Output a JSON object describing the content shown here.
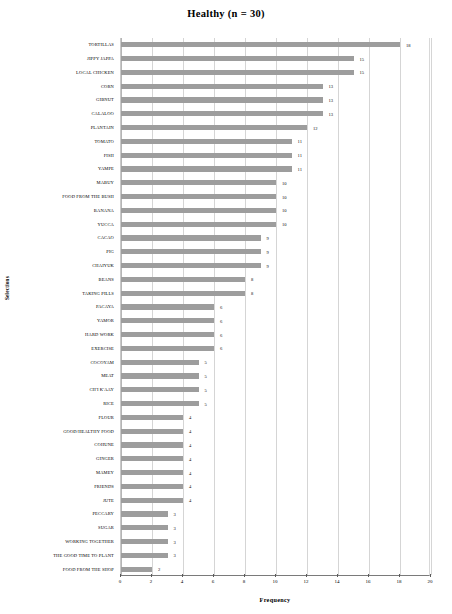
{
  "chart_data": {
    "type": "bar",
    "orientation": "horizontal",
    "title": "Healthy  (n = 30)",
    "xlabel": "Frequency",
    "ylabel": "Selections",
    "xlim": [
      0,
      20
    ],
    "xticks": [
      0,
      2,
      4,
      6,
      8,
      10,
      12,
      14,
      16,
      18,
      20
    ],
    "grid": "vertical",
    "legend": "none",
    "bar_color": "#9d9d9d",
    "categories": [
      "TORTILLAS",
      "JIPPY JAPPA",
      "LOCAL CHICKEN",
      "CORN",
      "GIBNUT",
      "CALALOO",
      "PLANTAIN",
      "TOMATO",
      "FISH",
      "YAMPE",
      "MABUY",
      "FOOD FROM THE BUSH",
      "BANANA",
      "YUCCA",
      "CACAO",
      "PIG",
      "CHAIYUK",
      "BEANS",
      "TAKING PILLS",
      "PACAYA",
      "YAMOR",
      "HARD WORK",
      "EXERCISE",
      "COCOYAM",
      "MEAT",
      "CH'I K'AAY",
      "RICE",
      "FLOUR",
      "GOOD/HEALTHY FOOD",
      "COHUNE",
      "GINGER",
      "MAMEY",
      "FRIENDS",
      "JUTE",
      "PECCARY",
      "SUGAR",
      "WORKING TOGETHER",
      "THE GOOD TIME TO PLANT",
      "FOOD FROM THE SHOP"
    ],
    "values": [
      18,
      15,
      15,
      13,
      13,
      13,
      12,
      11,
      11,
      11,
      10,
      10,
      10,
      10,
      9,
      9,
      9,
      8,
      8,
      6,
      6,
      6,
      6,
      5,
      5,
      5,
      5,
      4,
      4,
      4,
      4,
      4,
      4,
      4,
      3,
      3,
      3,
      3,
      2
    ]
  }
}
